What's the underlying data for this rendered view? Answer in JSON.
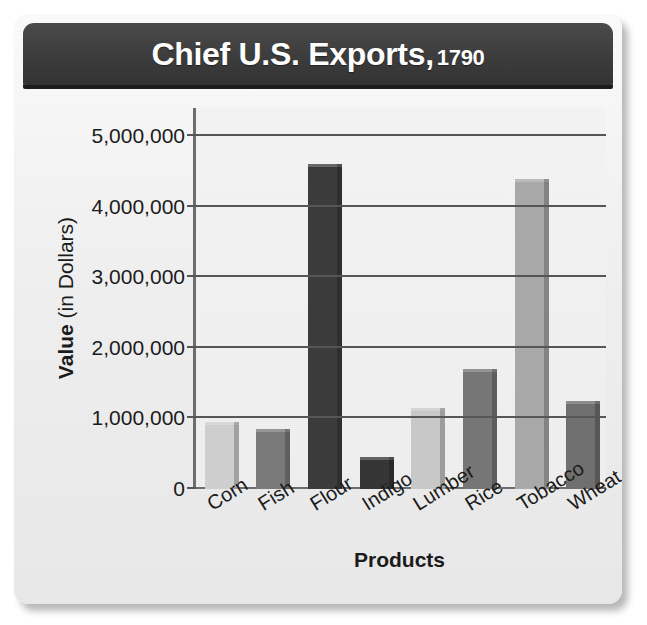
{
  "title": {
    "main": "Chief U.S. Exports,",
    "year": "1790"
  },
  "chart_data": {
    "type": "bar",
    "xlabel": "Products",
    "ylabel": "Value (in Dollars)",
    "ylabel_bold_part": "Value",
    "ylabel_regular_part": "(in Dollars)",
    "categories": [
      "Corn",
      "Fish",
      "Flour",
      "Indigo",
      "Lumber",
      "Rice",
      "Tobacco",
      "Wheat"
    ],
    "values": [
      950000,
      850000,
      4600000,
      450000,
      1150000,
      1700000,
      4400000,
      1250000
    ],
    "bar_colors": [
      "#cfcfcf",
      "#7a7a7a",
      "#3b3b3b",
      "#353535",
      "#c9c9c9",
      "#767676",
      "#a9a9a9",
      "#6f6f6f"
    ],
    "ylim": [
      0,
      5400000
    ],
    "ytick_values": [
      0,
      1000000,
      2000000,
      3000000,
      4000000,
      5000000
    ],
    "ytick_labels": [
      "0",
      "1,000,000",
      "2,000,000",
      "3,000,000",
      "4,000,000",
      "5,000,000"
    ],
    "gridlines": true,
    "legend": null,
    "colors": {
      "banner": "#3d3d3d",
      "banner_text": "#ffffff",
      "plot_background": "#f1f1f1",
      "gridline": "#555555",
      "axis": "#6d6d6d",
      "text": "#1a1a1a",
      "card_background": "#f2f2f2"
    }
  }
}
